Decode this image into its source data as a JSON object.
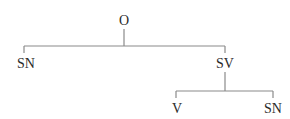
{
  "diagram": {
    "type": "syntax-tree",
    "colors": {
      "text": "#2a2a2a",
      "lines": "#8a8a8a",
      "background": "#ffffff"
    },
    "nodes": {
      "root": {
        "label": "O",
        "x": 124,
        "y": 25
      },
      "sn_left": {
        "label": "SN",
        "x": 26,
        "y": 68
      },
      "sv": {
        "label": "SV",
        "x": 225,
        "y": 68
      },
      "v": {
        "label": "V",
        "x": 177,
        "y": 113
      },
      "sn_right": {
        "label": "SN",
        "x": 273,
        "y": 113
      }
    },
    "edges": [
      {
        "from": "O",
        "to": "SN"
      },
      {
        "from": "O",
        "to": "SV"
      },
      {
        "from": "SV",
        "to": "V"
      },
      {
        "from": "SV",
        "to": "SN"
      }
    ]
  }
}
